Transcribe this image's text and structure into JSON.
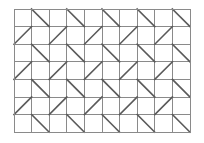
{
  "figure": {
    "title": "",
    "type": "geometric-tiling-pattern",
    "canvas": {
      "width": 204,
      "height": 143,
      "background_color": "#ffffff"
    },
    "grid": {
      "origin_x": 14,
      "origin_y": 9,
      "columns": 10,
      "rows": 7,
      "cell_width": 17.6,
      "cell_height": 17.6,
      "total_width": 176,
      "total_height": 123,
      "line_color": "#8a8a8a",
      "line_width": 1,
      "border_color": "#8a8a8a",
      "border_width": 1
    },
    "diagonals": {
      "color": "#5a5a5a",
      "line_width": 1.6,
      "description": "Alternating half-square triangles. Odd rows carry backslash diagonals in even columns; even rows carry forward-slash diagonals in odd columns.",
      "rows": [
        {
          "row": 1,
          "orientation": "backslash",
          "columns": [
            2,
            4,
            6,
            8,
            10
          ]
        },
        {
          "row": 2,
          "orientation": "slash",
          "columns": [
            1,
            3,
            5,
            7,
            9
          ]
        },
        {
          "row": 3,
          "orientation": "backslash",
          "columns": [
            2,
            4,
            6,
            8,
            10
          ]
        },
        {
          "row": 4,
          "orientation": "slash",
          "columns": [
            1,
            3,
            5,
            7,
            9
          ]
        },
        {
          "row": 5,
          "orientation": "backslash",
          "columns": [
            2,
            4,
            6,
            8,
            10
          ]
        },
        {
          "row": 6,
          "orientation": "slash",
          "columns": [
            1,
            3,
            5,
            7,
            9
          ]
        },
        {
          "row": 7,
          "orientation": "backslash",
          "columns": [
            2,
            4,
            6,
            8,
            10
          ]
        }
      ]
    }
  }
}
